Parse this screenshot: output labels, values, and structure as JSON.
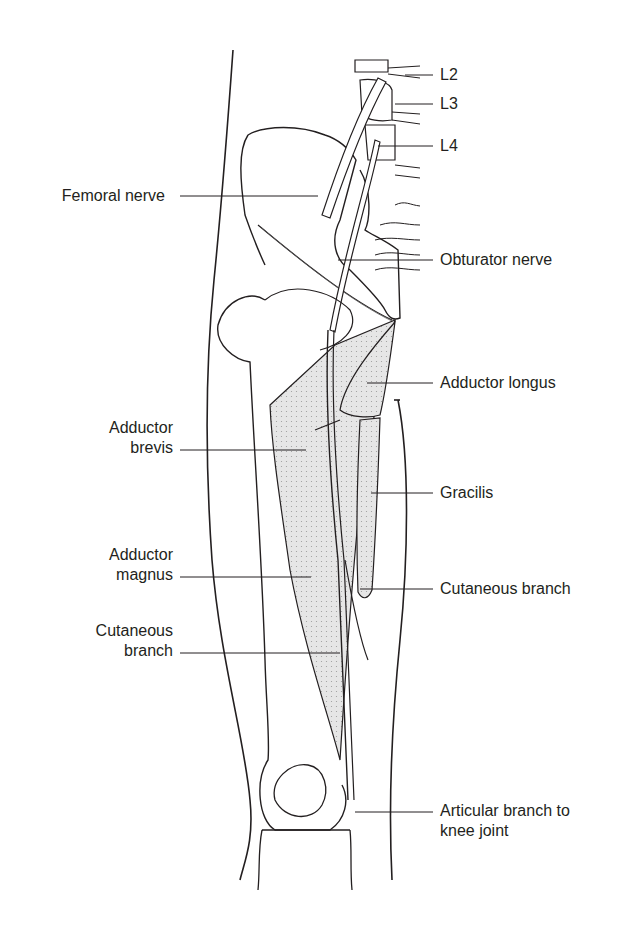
{
  "figure": {
    "labels_right": {
      "l2": "L2",
      "l3": "L3",
      "l4": "L4",
      "obturator_nerve": "Obturator nerve",
      "adductor_longus": "Adductor longus",
      "gracilis": "Gracilis",
      "cutaneous_branch": "Cutaneous branch",
      "articular_branch_line1": "Articular branch to",
      "articular_branch_line2": "knee joint"
    },
    "labels_left": {
      "femoral_nerve": "Femoral nerve",
      "adductor_brevis_line1": "Adductor",
      "adductor_brevis_line2": "brevis",
      "adductor_magnus_line1": "Adductor",
      "adductor_magnus_line2": "magnus",
      "cutaneous_branch_line1": "Cutaneous",
      "cutaneous_branch_line2": "branch"
    },
    "colors": {
      "ink": "#231f20",
      "muscle_fill": "#e4e4e4",
      "background": "#ffffff"
    }
  }
}
